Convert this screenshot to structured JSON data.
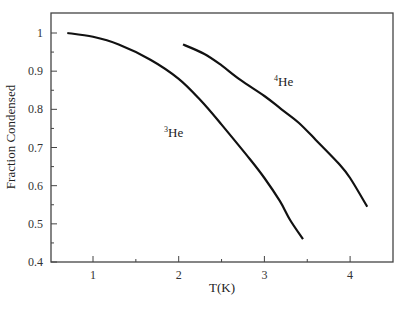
{
  "chart_data": {
    "type": "line",
    "title": "",
    "xlabel": "T(K)",
    "ylabel": "Fraction Condensed",
    "xlim": [
      0.3,
      4.6
    ],
    "ylim": [
      0.4,
      1.05
    ],
    "grid": false,
    "legend": "inline labels",
    "x_ticks": [
      1,
      2,
      3,
      4
    ],
    "x_tick_labels": [
      "1",
      "2",
      "3",
      "4"
    ],
    "x_minor_ticks": [
      1.5,
      2.5,
      3.5
    ],
    "y_ticks": [
      0.4,
      0.5,
      0.6,
      0.7,
      0.8,
      0.9,
      1.0
    ],
    "y_tick_labels": [
      "0.4",
      "0.5",
      "0.6",
      "0.7",
      "0.8",
      "0.9",
      "1"
    ],
    "y_minor_ticks": [
      0.45,
      0.55,
      0.65,
      0.75,
      0.85,
      0.95
    ],
    "series": [
      {
        "name": "3He",
        "label_mass": "3",
        "label_element": "He",
        "x": [
          0.7,
          1.0,
          1.3,
          1.67,
          2.0,
          2.25,
          2.5,
          2.83,
          3.0,
          3.18,
          3.3,
          3.45
        ],
        "y": [
          1.0,
          0.99,
          0.97,
          0.93,
          0.88,
          0.825,
          0.76,
          0.67,
          0.62,
          0.56,
          0.51,
          0.46
        ]
      },
      {
        "name": "4He",
        "label_mass": "4",
        "label_element": "He",
        "x": [
          2.05,
          2.3,
          2.5,
          2.72,
          3.0,
          3.2,
          3.4,
          3.6,
          3.88,
          4.0,
          4.2
        ],
        "y": [
          0.97,
          0.945,
          0.915,
          0.877,
          0.835,
          0.8,
          0.765,
          0.72,
          0.655,
          0.62,
          0.545
        ]
      }
    ]
  },
  "colors": {
    "line": "#111111",
    "axis": "#444444",
    "background": "#ffffff"
  }
}
